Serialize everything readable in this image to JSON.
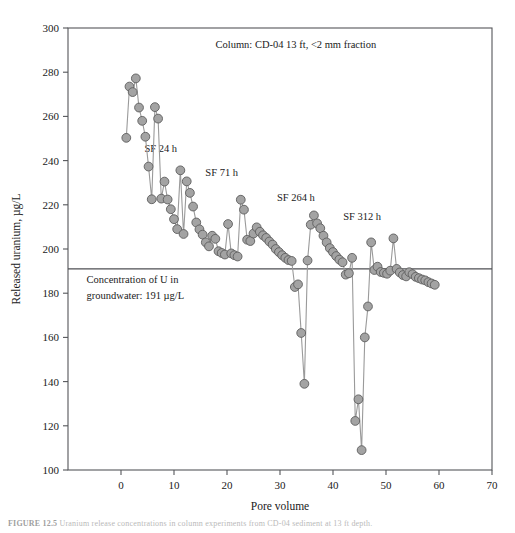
{
  "page_header": "",
  "caption": {
    "label": "FIGURE 12.5",
    "text": "Uranium release concentrations in column experiments from CD-04 sediment at 13 ft depth."
  },
  "chart_data": {
    "type": "scatter",
    "title": "",
    "xlabel": "Pore volume",
    "ylabel": "Released uranium, µg/L",
    "xlim": [
      -10,
      70
    ],
    "ylim": [
      100,
      300
    ],
    "xticks": [
      0,
      10,
      20,
      30,
      40,
      50,
      60,
      70
    ],
    "yticks": [
      100,
      120,
      140,
      160,
      180,
      200,
      220,
      240,
      260,
      280,
      300
    ],
    "grid": false,
    "legend": null,
    "marker_color": "#a3a3a3",
    "marker_edge_color": "#5d5d5d",
    "line_color": "#9a9a9a",
    "annotations": [
      {
        "name": "column-note",
        "text": "Column: CD-04 13 ft, <2 mm fraction",
        "x": 33.0,
        "y": 291.0,
        "anchor": "middle"
      },
      {
        "name": "sf-24h",
        "text": "SF 24 h",
        "x": 7.5,
        "y": 244.0,
        "anchor": "middle"
      },
      {
        "name": "sf-71h",
        "text": "SF 71 h",
        "x": 19.0,
        "y": 233.0,
        "anchor": "middle"
      },
      {
        "name": "sf-264h",
        "text": "SF 264 h",
        "x": 33.0,
        "y": 221.5,
        "anchor": "middle"
      },
      {
        "name": "sf-312h",
        "text": "SF 312 h",
        "x": 45.5,
        "y": 213.0,
        "anchor": "middle"
      }
    ],
    "reference_line": {
      "name": "groundwater-u-concentration",
      "value": 191,
      "label_line1": "Concentration of U in",
      "label_line2": "groundwater: 191 µg/L",
      "label_x": -6.5,
      "label_y1": 184.5,
      "label_y2": 177.5
    },
    "x": [
      1.0,
      1.6,
      2.2,
      2.8,
      3.4,
      4.0,
      4.6,
      5.2,
      5.8,
      6.4,
      7.0,
      7.6,
      8.2,
      8.8,
      9.4,
      10.0,
      10.6,
      11.2,
      11.8,
      12.4,
      13.0,
      13.6,
      14.2,
      14.8,
      15.4,
      16.0,
      16.6,
      17.2,
      17.8,
      18.4,
      19.0,
      19.6,
      20.2,
      20.8,
      21.4,
      22.0,
      22.6,
      23.2,
      23.8,
      24.4,
      25.0,
      25.6,
      26.2,
      26.8,
      27.4,
      28.0,
      28.6,
      29.2,
      29.8,
      30.4,
      31.0,
      31.6,
      32.2,
      32.8,
      33.4,
      34.0,
      34.6,
      35.2,
      35.8,
      36.4,
      37.0,
      37.6,
      38.2,
      38.8,
      39.4,
      40.0,
      40.6,
      41.2,
      41.8,
      42.4,
      43.0,
      43.6,
      44.2,
      44.8,
      45.4,
      46.0,
      46.6,
      47.2,
      47.8,
      48.4,
      49.0,
      49.6,
      50.2,
      50.8,
      51.4,
      52.0,
      52.6,
      53.2,
      53.8,
      54.4,
      55.0,
      55.6,
      56.2,
      56.8,
      57.4,
      58.0,
      58.6,
      59.2
    ],
    "values": [
      250.3,
      273.5,
      271.0,
      277.2,
      264.0,
      258.0,
      250.8,
      237.3,
      222.5,
      264.2,
      259.0,
      222.8,
      230.5,
      222.4,
      218.0,
      213.5,
      209.0,
      235.6,
      206.8,
      230.6,
      225.4,
      219.2,
      212.0,
      208.9,
      206.5,
      203.0,
      201.2,
      206.0,
      204.6,
      199.0,
      198.2,
      197.5,
      211.3,
      198.0,
      197.2,
      196.6,
      222.3,
      217.8,
      204.2,
      203.6,
      207.0,
      209.8,
      207.8,
      206.2,
      205.0,
      203.4,
      202.0,
      200.0,
      198.6,
      197.2,
      196.0,
      195.0,
      194.6,
      182.8,
      184.0,
      162.0,
      139.0,
      194.8,
      211.0,
      215.2,
      211.6,
      209.4,
      206.0,
      203.0,
      200.4,
      198.6,
      196.8,
      195.2,
      194.0,
      188.4,
      189.0,
      196.0,
      122.2,
      132.0,
      109.0,
      160.0,
      174.0,
      203.0,
      190.5,
      192.0,
      189.6,
      189.2,
      188.8,
      190.2,
      204.8,
      191.0,
      189.4,
      188.2,
      187.6,
      189.5,
      188.6,
      187.4,
      186.8,
      186.2,
      185.8,
      185.0,
      184.4,
      183.8
    ]
  }
}
